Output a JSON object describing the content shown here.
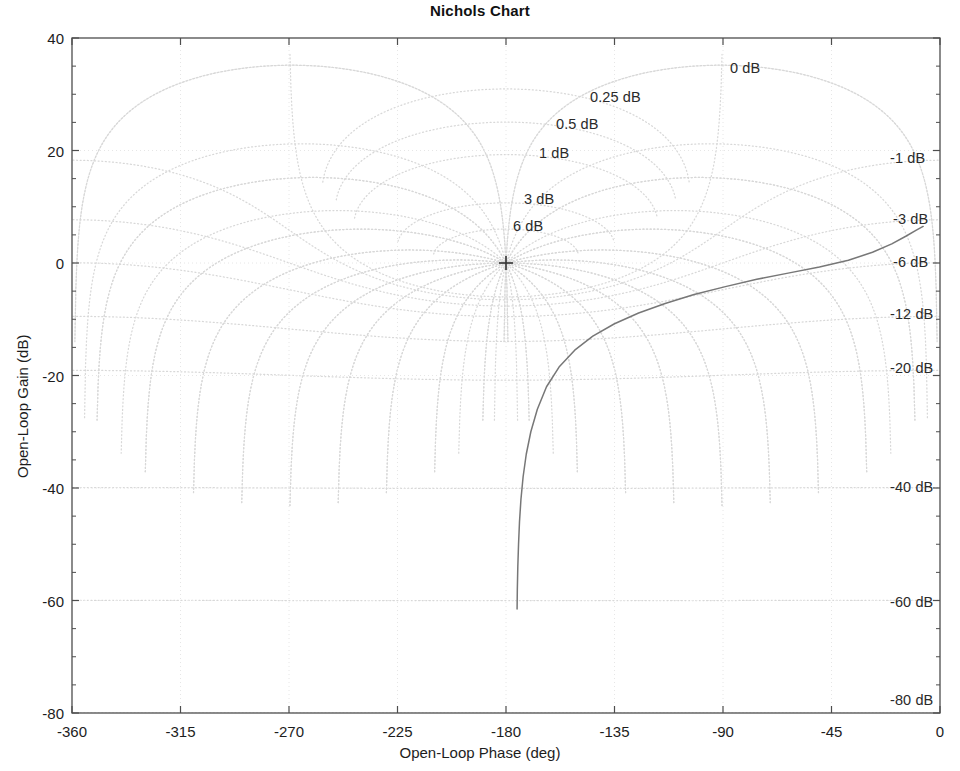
{
  "figure": {
    "title": "Nichols Chart",
    "background_color": "#ffffff",
    "axis_color": "#4d4d4d",
    "grid_color": "#d8d8d8",
    "curve_color": "#777777"
  },
  "axes": {
    "x_label": "Open-Loop Phase (deg)",
    "y_label": "Open-Loop Gain (dB)",
    "x_ticks": [
      "-360",
      "-315",
      "-270",
      "-225",
      "-180",
      "-135",
      "-90",
      "-45",
      "0"
    ],
    "y_ticks": [
      "40",
      "20",
      "0",
      "-20",
      "-40",
      "-60",
      "-80"
    ]
  },
  "grid_labels_positive": [
    {
      "text": "0 dB",
      "x": 730,
      "y": 68
    },
    {
      "text": "0.25 dB",
      "x": 590,
      "y": 97
    },
    {
      "text": "0.5 dB",
      "x": 556,
      "y": 124
    },
    {
      "text": "1 dB",
      "x": 539,
      "y": 153
    },
    {
      "text": "3 dB",
      "x": 524,
      "y": 199
    },
    {
      "text": "6 dB",
      "x": 513,
      "y": 226
    }
  ],
  "grid_labels_negative": [
    {
      "text": "-1 dB",
      "x": 890,
      "y": 158
    },
    {
      "text": "-3 dB",
      "x": 893,
      "y": 219
    },
    {
      "text": "-6 dB",
      "x": 893,
      "y": 262
    },
    {
      "text": "-12 dB",
      "x": 890,
      "y": 314
    },
    {
      "text": "-20 dB",
      "x": 890,
      "y": 368
    },
    {
      "text": "-40 dB",
      "x": 890,
      "y": 487
    },
    {
      "text": "-60 dB",
      "x": 890,
      "y": 602
    },
    {
      "text": "-80 dB",
      "x": 890,
      "y": 700
    }
  ],
  "critical_point": {
    "phase": -180,
    "gain": 0,
    "marker": "+"
  },
  "chart_data": {
    "type": "line",
    "title": "Nichols Chart",
    "xlabel": "Open-Loop Phase (deg)",
    "ylabel": "Open-Loop Gain (dB)",
    "xlim": [
      -360,
      0
    ],
    "ylim": [
      -80,
      40
    ],
    "xticks": [
      -360,
      -315,
      -270,
      -225,
      -180,
      -135,
      -90,
      -45,
      0
    ],
    "yticks": [
      40,
      20,
      0,
      -20,
      -40,
      -60,
      -80
    ],
    "grid": true,
    "legend": "none",
    "nichols_grid": {
      "closed_loop_magnitudes_db_positive": [
        0,
        0.25,
        0.5,
        1,
        3,
        6
      ],
      "closed_loop_magnitudes_db_negative": [
        -1,
        -3,
        -6,
        -12,
        -20,
        -40,
        -60,
        -80
      ],
      "phase_contours_deg": [
        -1,
        -5,
        -10,
        -20,
        -30,
        -50,
        -70,
        -90,
        -110,
        -130,
        -150,
        -170,
        -179
      ]
    },
    "series": [
      {
        "name": "open-loop response",
        "points": [
          [
            -175.4,
            -61.5
          ],
          [
            -175.3,
            -58.0
          ],
          [
            -175.1,
            -54.0
          ],
          [
            -174.8,
            -50.0
          ],
          [
            -174.4,
            -46.0
          ],
          [
            -173.8,
            -42.0
          ],
          [
            -172.9,
            -38.0
          ],
          [
            -171.6,
            -34.0
          ],
          [
            -169.7,
            -30.0
          ],
          [
            -167.0,
            -26.0
          ],
          [
            -163.2,
            -22.0
          ],
          [
            -158.0,
            -18.5
          ],
          [
            -151.5,
            -15.5
          ],
          [
            -144.0,
            -13.0
          ],
          [
            -135.0,
            -10.8
          ],
          [
            -125.0,
            -8.9
          ],
          [
            -114.0,
            -7.2
          ],
          [
            -102.0,
            -5.6
          ],
          [
            -89.0,
            -4.2
          ],
          [
            -76.0,
            -2.9
          ],
          [
            -63.0,
            -1.8
          ],
          [
            -50.0,
            -0.7
          ],
          [
            -38.0,
            0.5
          ],
          [
            -28.0,
            1.9
          ],
          [
            -20.0,
            3.4
          ],
          [
            -14.0,
            4.8
          ],
          [
            -10.0,
            5.8
          ],
          [
            -7.0,
            6.5
          ]
        ]
      }
    ]
  }
}
